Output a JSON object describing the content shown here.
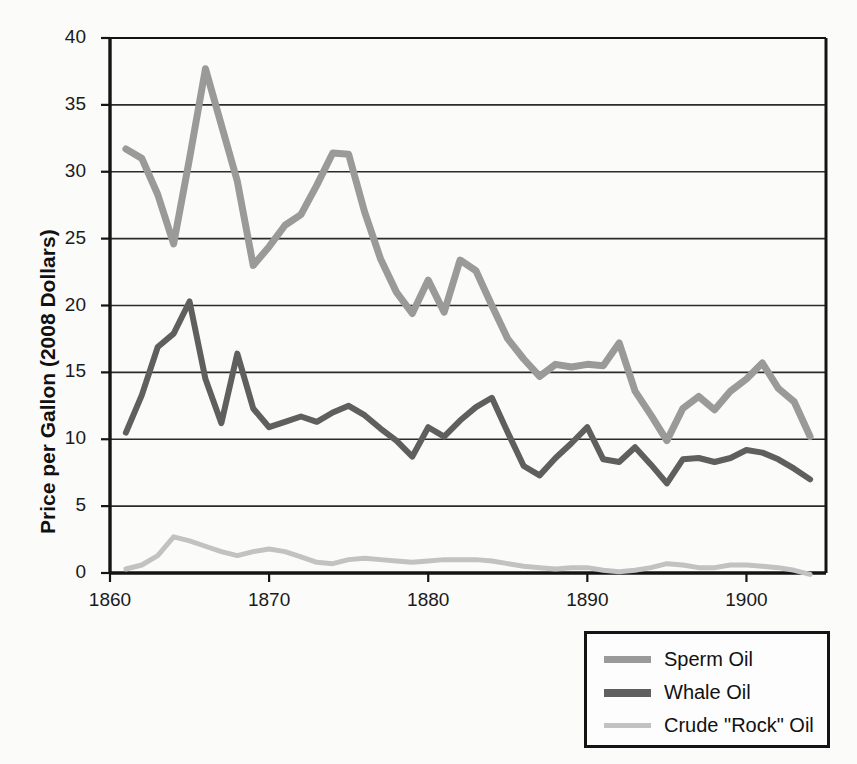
{
  "chart_data": {
    "type": "line",
    "title": "",
    "xlabel": "",
    "ylabel": "Price per Gallon (2008 Dollars)",
    "xlim": [
      1860,
      1905
    ],
    "ylim": [
      0,
      40
    ],
    "ytick_values": [
      0,
      5,
      10,
      15,
      20,
      25,
      30,
      35,
      40
    ],
    "ytick_labels": [
      "0",
      "5",
      "10",
      "15",
      "20",
      "25",
      "30",
      "35",
      "40"
    ],
    "xtick_values": [
      1860,
      1870,
      1880,
      1890,
      1900
    ],
    "xtick_labels": [
      "1860",
      "1870",
      "1880",
      "1890",
      "1900"
    ],
    "grid": "horizontal",
    "legend_position": "below-right",
    "x": [
      1861,
      1862,
      1863,
      1864,
      1865,
      1866,
      1867,
      1868,
      1869,
      1870,
      1871,
      1872,
      1873,
      1874,
      1875,
      1876,
      1877,
      1878,
      1879,
      1880,
      1881,
      1882,
      1883,
      1884,
      1885,
      1886,
      1887,
      1888,
      1889,
      1890,
      1891,
      1892,
      1893,
      1894,
      1895,
      1896,
      1897,
      1898,
      1899,
      1900,
      1901,
      1902,
      1903,
      1904
    ],
    "series": [
      {
        "name": "Sperm Oil",
        "color": "#9a9a9a",
        "width": 7,
        "values": [
          31.7,
          31.0,
          28.3,
          24.6,
          31.0,
          37.7,
          33.5,
          29.3,
          23.0,
          24.4,
          26.0,
          26.8,
          29.0,
          31.4,
          31.3,
          27.0,
          23.5,
          21.0,
          19.4,
          21.9,
          19.5,
          23.4,
          22.6,
          20.0,
          17.5,
          16.0,
          14.7,
          15.6,
          15.4,
          15.6,
          15.5,
          17.2,
          13.6,
          11.8,
          9.9,
          12.3,
          13.2,
          12.2,
          13.6,
          14.5,
          15.7,
          13.8,
          12.8,
          10.2
        ]
      },
      {
        "name": "Whale Oil",
        "color": "#5f5f5f",
        "width": 6,
        "values": [
          10.5,
          13.3,
          16.9,
          17.9,
          20.3,
          14.5,
          11.2,
          16.4,
          12.3,
          10.9,
          11.3,
          11.7,
          11.3,
          12.0,
          12.5,
          11.8,
          10.8,
          9.9,
          8.7,
          10.9,
          10.2,
          11.4,
          12.4,
          13.1,
          10.5,
          8.0,
          7.3,
          8.6,
          9.7,
          10.9,
          8.5,
          8.3,
          9.4,
          8.1,
          6.7,
          8.5,
          8.6,
          8.3,
          8.6,
          9.2,
          9.0,
          8.5,
          7.8,
          7.0
        ]
      },
      {
        "name": "Crude \"Rock\" Oil",
        "color": "#c2c2c2",
        "width": 5,
        "values": [
          0.3,
          0.6,
          1.3,
          2.7,
          2.4,
          2.0,
          1.6,
          1.3,
          1.6,
          1.8,
          1.6,
          1.2,
          0.8,
          0.7,
          1.0,
          1.1,
          1.0,
          0.9,
          0.8,
          0.9,
          1.0,
          1.0,
          1.0,
          0.9,
          0.7,
          0.5,
          0.4,
          0.3,
          0.4,
          0.4,
          0.2,
          0.1,
          0.2,
          0.4,
          0.7,
          0.6,
          0.4,
          0.4,
          0.6,
          0.6,
          0.5,
          0.4,
          0.2,
          -0.1
        ]
      }
    ]
  },
  "legend": {
    "items": [
      {
        "label": "Sperm Oil",
        "color": "#9a9a9a"
      },
      {
        "label": "Whale Oil",
        "color": "#5f5f5f"
      },
      {
        "label": "Crude \"Rock\" Oil",
        "color": "#c2c2c2"
      }
    ]
  },
  "colors": {
    "axis": "#141414",
    "grid": "#2b2b2b",
    "text": "#111111",
    "background": "#fbfbfa"
  }
}
